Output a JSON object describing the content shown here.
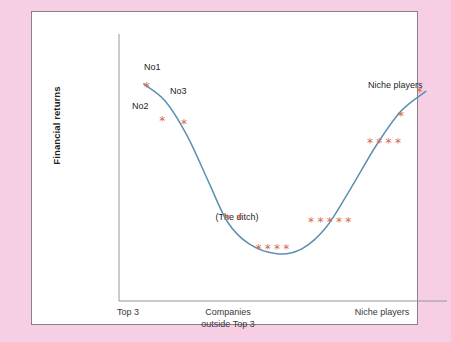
{
  "figure": {
    "background_color": "#f6cfe4",
    "panel_color": "#ffffff",
    "panel_border_color": "#8a8188"
  },
  "chart_data": {
    "type": "scatter",
    "title": "",
    "subtitle": "",
    "xlabel": "",
    "ylabel": "Financial returns",
    "grid": false,
    "legend_position": "none",
    "axis_color": "#9a9498",
    "curve_color": "#5b8fb0",
    "marker_color": "#d6674b",
    "marker_glyph": "*",
    "xlim": [
      0,
      100
    ],
    "ylim": [
      0,
      100
    ],
    "x_tick_labels": [
      "Top 3",
      "Companies outside Top 3",
      "Niche players"
    ],
    "x_tick_positions": [
      13,
      50,
      87
    ],
    "y_tick_labels": [],
    "curve": {
      "name": "Financial returns curve",
      "points": [
        {
          "x": 7,
          "y": 87
        },
        {
          "x": 14,
          "y": 80
        },
        {
          "x": 21,
          "y": 66
        },
        {
          "x": 28,
          "y": 47
        },
        {
          "x": 34,
          "y": 31
        },
        {
          "x": 41,
          "y": 22
        },
        {
          "x": 50,
          "y": 18
        },
        {
          "x": 58,
          "y": 20
        },
        {
          "x": 66,
          "y": 29
        },
        {
          "x": 74,
          "y": 45
        },
        {
          "x": 82,
          "y": 62
        },
        {
          "x": 90,
          "y": 76
        },
        {
          "x": 98,
          "y": 84
        }
      ]
    },
    "series": [
      {
        "name": "Top 3 leaders",
        "points": [
          {
            "x": 8,
            "y": 86,
            "label": "No1"
          },
          {
            "x": 13,
            "y": 72,
            "label": "No2"
          },
          {
            "x": 20,
            "y": 71,
            "label": "No3"
          }
        ]
      },
      {
        "name": "Companies outside Top 3 (the ditch)",
        "points": [
          {
            "x": 34,
            "y": 32,
            "label": ""
          },
          {
            "x": 38,
            "y": 32,
            "label": ""
          },
          {
            "x": 44,
            "y": 20,
            "label": ""
          },
          {
            "x": 47,
            "y": 20,
            "label": ""
          },
          {
            "x": 50,
            "y": 20,
            "label": ""
          },
          {
            "x": 53,
            "y": 20,
            "label": ""
          },
          {
            "x": 61,
            "y": 31,
            "label": ""
          },
          {
            "x": 64,
            "y": 31,
            "label": ""
          },
          {
            "x": 67,
            "y": 31,
            "label": ""
          },
          {
            "x": 70,
            "y": 31,
            "label": ""
          },
          {
            "x": 73,
            "y": 31,
            "label": ""
          }
        ]
      },
      {
        "name": "Niche players",
        "points": [
          {
            "x": 80,
            "y": 63,
            "label": ""
          },
          {
            "x": 83,
            "y": 63,
            "label": ""
          },
          {
            "x": 86,
            "y": 63,
            "label": ""
          },
          {
            "x": 89,
            "y": 63,
            "label": ""
          },
          {
            "x": 90,
            "y": 74,
            "label": ""
          },
          {
            "x": 96,
            "y": 84,
            "label": "Niche players"
          }
        ]
      }
    ],
    "annotations": [
      {
        "text": "No1",
        "x": 11,
        "y": 84
      },
      {
        "text": "No2",
        "x": 10,
        "y": 66
      },
      {
        "text": "No3",
        "x": 23,
        "y": 72
      },
      {
        "text": "Niche players",
        "x": 83,
        "y": 68
      },
      {
        "text": "(The ditch)",
        "x": 47,
        "y": 11
      }
    ]
  },
  "axis": {
    "y_label": "Financial returns",
    "x_tick_1": "Top 3",
    "x_tick_2_line1": "Companies",
    "x_tick_2_line2": "outside Top 3",
    "x_tick_3": "Niche players"
  },
  "labels": {
    "no1": "No1",
    "no2": "No2",
    "no3": "No3",
    "niche_players": "Niche players",
    "the_ditch": "(The ditch)"
  }
}
